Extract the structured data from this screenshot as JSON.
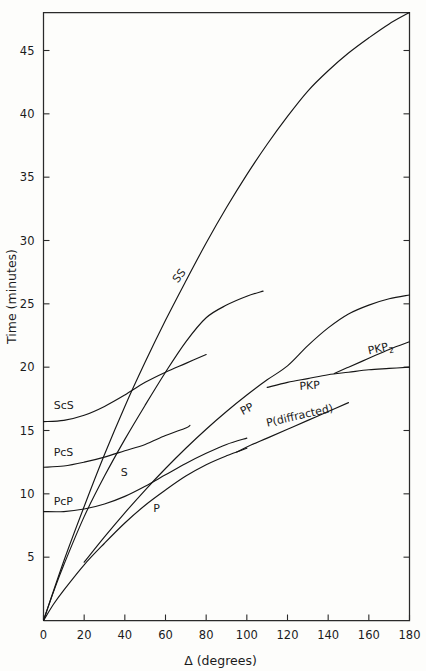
{
  "figure": {
    "background_color": "#fdfdfb",
    "line_color": "#161616",
    "frame_color": "#2a2a2a"
  },
  "chart_data": {
    "type": "line",
    "title": "",
    "xlabel": "Δ (degrees)",
    "ylabel": "Time (minutes)",
    "xlim": [
      0,
      180
    ],
    "ylim": [
      0,
      48
    ],
    "xticks": [
      0,
      20,
      40,
      60,
      80,
      100,
      120,
      140,
      160,
      180
    ],
    "xticklabels": [
      "0",
      "20",
      "40",
      "60",
      "80",
      "100",
      "120",
      "140",
      "160",
      "180"
    ],
    "yticks": [
      5,
      10,
      15,
      20,
      25,
      30,
      35,
      40,
      45
    ],
    "yticklabels": [
      "5",
      "10",
      "15",
      "20",
      "25",
      "30",
      "35",
      "40",
      "45"
    ],
    "grid": false,
    "legend": "inline-curve-labels",
    "series": [
      {
        "name": "P",
        "label": "P",
        "label_x": 54,
        "label_y": 8.6,
        "label_rotation": 0,
        "points": [
          [
            0,
            0
          ],
          [
            5,
            1.3
          ],
          [
            10,
            2.4
          ],
          [
            20,
            4.4
          ],
          [
            30,
            6.1
          ],
          [
            40,
            7.7
          ],
          [
            50,
            9.1
          ],
          [
            60,
            10.3
          ],
          [
            70,
            11.4
          ],
          [
            80,
            12.3
          ],
          [
            90,
            13.0
          ],
          [
            100,
            13.6
          ]
        ]
      },
      {
        "name": "P(diffracted)",
        "label": "P(diffracted)",
        "label_x": 110,
        "label_y": 15.3,
        "label_rotation": -13,
        "points": [
          [
            95,
            13.3
          ],
          [
            100,
            13.7
          ],
          [
            110,
            14.4
          ],
          [
            120,
            15.1
          ],
          [
            130,
            15.8
          ],
          [
            140,
            16.5
          ],
          [
            150,
            17.2
          ]
        ]
      },
      {
        "name": "S",
        "label": "S",
        "label_x": 38,
        "label_y": 11.4,
        "label_rotation": 0,
        "points": [
          [
            0,
            0
          ],
          [
            5,
            2.3
          ],
          [
            10,
            4.4
          ],
          [
            20,
            8.2
          ],
          [
            30,
            11.4
          ],
          [
            40,
            14.3
          ],
          [
            50,
            17.0
          ],
          [
            60,
            19.6
          ],
          [
            70,
            22.0
          ],
          [
            80,
            23.9
          ],
          [
            90,
            24.9
          ],
          [
            100,
            25.6
          ],
          [
            108,
            26.0
          ]
        ]
      },
      {
        "name": "SS",
        "label": "SS",
        "label_x": 66,
        "label_y": 26.6,
        "label_rotation": -52,
        "points": [
          [
            0,
            0
          ],
          [
            10,
            4.7
          ],
          [
            20,
            9.0
          ],
          [
            30,
            13.1
          ],
          [
            40,
            16.9
          ],
          [
            50,
            20.4
          ],
          [
            60,
            23.7
          ],
          [
            70,
            26.8
          ],
          [
            80,
            29.8
          ],
          [
            90,
            32.6
          ],
          [
            100,
            35.2
          ],
          [
            110,
            37.6
          ],
          [
            120,
            39.8
          ],
          [
            130,
            41.8
          ],
          [
            140,
            43.4
          ],
          [
            150,
            44.8
          ],
          [
            160,
            46.0
          ],
          [
            170,
            47.1
          ],
          [
            180,
            48.0
          ]
        ]
      },
      {
        "name": "PP",
        "label": "PP",
        "label_x": 98,
        "label_y": 16.2,
        "label_rotation": -28,
        "points": [
          [
            20,
            4.6
          ],
          [
            30,
            6.6
          ],
          [
            40,
            8.5
          ],
          [
            50,
            10.3
          ],
          [
            60,
            12.0
          ],
          [
            70,
            13.6
          ],
          [
            80,
            15.1
          ],
          [
            90,
            16.5
          ],
          [
            100,
            17.8
          ],
          [
            110,
            19.0
          ],
          [
            120,
            20.1
          ],
          [
            130,
            21.7
          ],
          [
            140,
            23.1
          ],
          [
            150,
            24.2
          ],
          [
            160,
            24.9
          ],
          [
            170,
            25.4
          ],
          [
            180,
            25.7
          ]
        ]
      },
      {
        "name": "PcP",
        "label": "PcP",
        "label_x": 5,
        "label_y": 9.1,
        "label_rotation": 0,
        "points": [
          [
            0,
            8.6
          ],
          [
            10,
            8.6
          ],
          [
            20,
            8.8
          ],
          [
            30,
            9.2
          ],
          [
            40,
            9.8
          ],
          [
            50,
            10.6
          ],
          [
            60,
            11.5
          ],
          [
            70,
            12.4
          ],
          [
            80,
            13.2
          ],
          [
            90,
            13.9
          ],
          [
            100,
            14.4
          ]
        ]
      },
      {
        "name": "PcS",
        "label": "PcS",
        "label_x": 5,
        "label_y": 13.0,
        "label_rotation": 0,
        "points": [
          [
            0,
            12.1
          ],
          [
            10,
            12.2
          ],
          [
            20,
            12.5
          ],
          [
            30,
            12.9
          ],
          [
            40,
            13.4
          ],
          [
            50,
            13.9
          ],
          [
            60,
            14.6
          ],
          [
            70,
            15.2
          ],
          [
            72,
            15.4
          ]
        ]
      },
      {
        "name": "ScS",
        "label": "ScS",
        "label_x": 5,
        "label_y": 16.7,
        "label_rotation": 0,
        "points": [
          [
            0,
            15.7
          ],
          [
            10,
            15.8
          ],
          [
            20,
            16.2
          ],
          [
            30,
            16.9
          ],
          [
            40,
            17.8
          ],
          [
            50,
            18.8
          ],
          [
            60,
            19.6
          ],
          [
            70,
            20.3
          ],
          [
            80,
            21.0
          ]
        ]
      },
      {
        "name": "PKP",
        "label": "PKP",
        "label_x": 126,
        "label_y": 18.2,
        "label_rotation": -4,
        "points": [
          [
            110,
            18.4
          ],
          [
            120,
            18.8
          ],
          [
            130,
            19.1
          ],
          [
            140,
            19.4
          ],
          [
            150,
            19.6
          ],
          [
            160,
            19.8
          ],
          [
            170,
            19.9
          ],
          [
            180,
            20.0
          ]
        ]
      },
      {
        "name": "PKP2",
        "label": "PKP₂",
        "label_x": 160,
        "label_y": 21.0,
        "label_rotation": -12,
        "points": [
          [
            143,
            19.5
          ],
          [
            150,
            20.0
          ],
          [
            160,
            20.7
          ],
          [
            170,
            21.4
          ],
          [
            180,
            22.0
          ]
        ]
      }
    ]
  }
}
